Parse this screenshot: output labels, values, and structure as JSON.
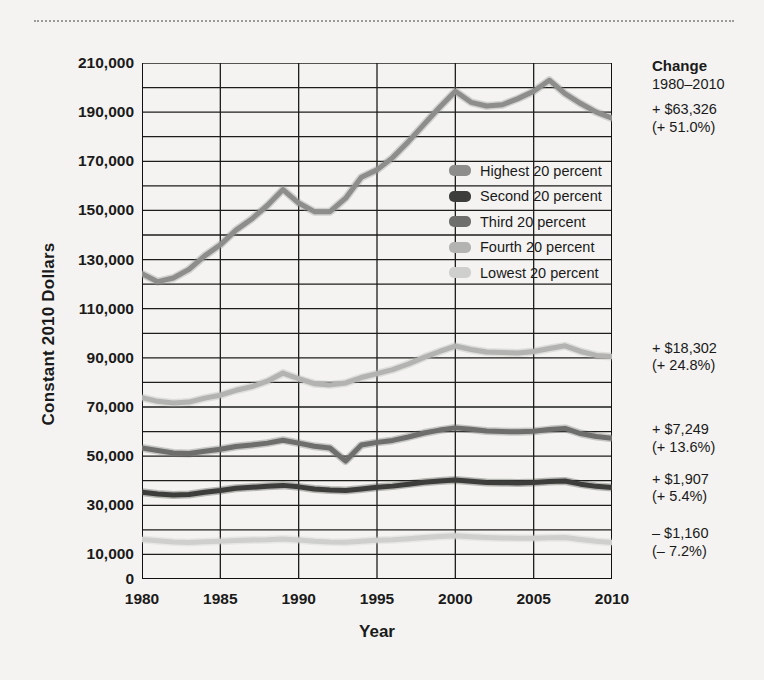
{
  "chart_data": {
    "type": "line",
    "title": "",
    "xlabel": "Year",
    "ylabel": "Constant 2010 Dollars",
    "xlim": [
      1980,
      2010
    ],
    "ylim": [
      0,
      210000
    ],
    "grid": true,
    "legend_position": "inside-right-upper",
    "xticks": [
      "1980",
      "1985",
      "1990",
      "1995",
      "2000",
      "2005",
      "2010"
    ],
    "yticks": [
      "0",
      "10,000",
      "30,000",
      "50,000",
      "70,000",
      "90,000",
      "110,000",
      "130,000",
      "150,000",
      "170,000",
      "190,000",
      "210,000"
    ],
    "ytick_values": [
      0,
      10000,
      30000,
      50000,
      70000,
      90000,
      110000,
      130000,
      150000,
      170000,
      190000,
      210000
    ],
    "gridline_values": [
      0,
      10000,
      20000,
      30000,
      40000,
      50000,
      60000,
      70000,
      80000,
      90000,
      100000,
      110000,
      120000,
      130000,
      140000,
      150000,
      160000,
      170000,
      180000,
      190000,
      200000,
      210000
    ],
    "x": [
      1980,
      1981,
      1982,
      1983,
      1984,
      1985,
      1986,
      1987,
      1988,
      1989,
      1990,
      1991,
      1992,
      1993,
      1994,
      1995,
      1996,
      1997,
      1998,
      1999,
      2000,
      2001,
      2002,
      2003,
      2004,
      2005,
      2006,
      2007,
      2008,
      2009,
      2010
    ],
    "series": [
      {
        "name": "Highest 20 percent",
        "color": "#8d8d8b",
        "values": [
          124200,
          121000,
          122500,
          126000,
          131500,
          136000,
          142000,
          146500,
          152000,
          158500,
          153000,
          149500,
          149500,
          155000,
          163500,
          166500,
          171500,
          178000,
          185000,
          192000,
          198500,
          194000,
          192500,
          193000,
          195500,
          198500,
          203000,
          197500,
          193500,
          190000,
          187500
        ]
      },
      {
        "name": "Second 20 percent",
        "color": "#3d3d3b",
        "values": [
          35300,
          34600,
          34200,
          34400,
          35300,
          36000,
          36900,
          37300,
          37700,
          38100,
          37500,
          36600,
          36200,
          36000,
          36600,
          37300,
          37800,
          38600,
          39400,
          39900,
          40300,
          39800,
          39300,
          39200,
          39100,
          39300,
          39700,
          39900,
          38600,
          37700,
          37200
        ]
      },
      {
        "name": "Third 20 percent",
        "color": "#6e6e6c",
        "values": [
          53300,
          52300,
          51300,
          51100,
          52000,
          52800,
          53900,
          54500,
          55300,
          56500,
          55300,
          54000,
          53300,
          48000,
          54500,
          55600,
          56400,
          57800,
          59400,
          60600,
          61500,
          60900,
          60200,
          60000,
          59900,
          60100,
          60800,
          61300,
          59200,
          58000,
          57300
        ]
      },
      {
        "name": "Fourth 20 percent",
        "color": "#b3b3b1",
        "values": [
          73800,
          72300,
          71600,
          72000,
          73600,
          74800,
          76800,
          78300,
          80500,
          83800,
          81500,
          79500,
          79000,
          79800,
          82000,
          83600,
          85200,
          87500,
          90200,
          92600,
          94800,
          93400,
          92400,
          92200,
          92000,
          92600,
          93800,
          94900,
          92600,
          91000,
          90500
        ]
      },
      {
        "name": "Lowest 20 percent",
        "color": "#cfcfcd",
        "values": [
          16100,
          15600,
          15100,
          14900,
          15200,
          15400,
          15700,
          15900,
          16000,
          16300,
          15900,
          15400,
          15100,
          15000,
          15400,
          15800,
          16000,
          16400,
          16900,
          17300,
          17600,
          17200,
          16900,
          16700,
          16600,
          16600,
          16800,
          16900,
          16100,
          15400,
          14900
        ]
      }
    ],
    "annotations": {
      "header_title": "Change",
      "header_range": "1980–2010",
      "items": [
        {
          "series": "Highest 20 percent",
          "amount": "+ $63,326",
          "percent": "(+ 51.0%)"
        },
        {
          "series": "Fourth 20 percent",
          "amount": "+ $18,302",
          "percent": "(+ 24.8%)"
        },
        {
          "series": "Third 20 percent",
          "amount": "+ $7,249",
          "percent": "(+ 13.6%)"
        },
        {
          "series": "Second 20 percent",
          "amount": "+ $1,907",
          "percent": "(+ 5.4%)"
        },
        {
          "series": "Lowest 20 percent",
          "amount": "– $1,160",
          "percent": "(– 7.2%)"
        }
      ]
    }
  }
}
